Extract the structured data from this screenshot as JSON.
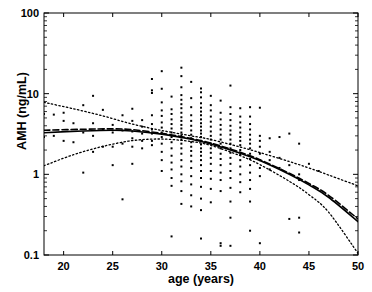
{
  "figure": {
    "name": "amh-vs-age-scatter-regression",
    "background": "#ffffff",
    "foreground": "#000000"
  },
  "chart_data": {
    "type": "scatter",
    "title": "",
    "xlabel": "age (years)",
    "ylabel": "AMH (ng/mL)",
    "xlim": [
      18,
      50
    ],
    "ylim": [
      0.1,
      100
    ],
    "yscale": "log",
    "xscale": "linear",
    "grid": false,
    "legend": "none",
    "xticks": [
      20,
      25,
      30,
      35,
      40,
      45,
      50
    ],
    "xtick_labels": [
      "20",
      "25",
      "30",
      "35",
      "40",
      "45",
      "50"
    ],
    "yticks": [
      0.1,
      1,
      10,
      100
    ],
    "ytick_labels": [
      "0.1",
      "1",
      "10",
      "100"
    ],
    "minor_log_ticks": true,
    "marker": "square",
    "marker_size": 2,
    "marker_color": "#000000",
    "series": [
      {
        "name": "AMH observations",
        "type": "scatter",
        "points": [
          [
            18,
            5.6
          ],
          [
            18,
            2.9
          ],
          [
            19,
            5.5
          ],
          [
            19,
            3.0
          ],
          [
            20,
            5.8
          ],
          [
            20,
            4.6
          ],
          [
            20,
            2.6
          ],
          [
            21,
            4.3
          ],
          [
            21,
            2.5
          ],
          [
            22,
            7.2
          ],
          [
            22,
            3.3
          ],
          [
            22,
            1.05
          ],
          [
            23,
            9.4
          ],
          [
            23,
            4.3
          ],
          [
            23,
            3.0
          ],
          [
            23,
            1.9
          ],
          [
            24,
            6.3
          ],
          [
            24,
            3.6
          ],
          [
            24,
            2.2
          ],
          [
            25,
            4.1
          ],
          [
            25,
            3.3
          ],
          [
            25,
            2.2
          ],
          [
            25,
            1.3
          ],
          [
            26,
            5.4
          ],
          [
            26,
            3.5
          ],
          [
            26,
            2.4
          ],
          [
            26,
            0.49
          ],
          [
            27,
            6.5
          ],
          [
            27,
            4.6
          ],
          [
            27,
            3.4
          ],
          [
            27,
            2.8
          ],
          [
            27,
            2.2
          ],
          [
            27,
            1.35
          ],
          [
            28,
            4.7
          ],
          [
            28,
            3.9
          ],
          [
            28,
            3.2
          ],
          [
            28,
            2.6
          ],
          [
            28,
            2.1
          ],
          [
            29,
            15.2
          ],
          [
            29,
            11.0
          ],
          [
            29,
            10.2
          ],
          [
            29,
            5.4
          ],
          [
            29,
            4.2
          ],
          [
            29,
            3.6
          ],
          [
            29,
            3.2
          ],
          [
            29,
            2.6
          ],
          [
            29,
            2.3
          ],
          [
            30,
            19.0
          ],
          [
            30,
            11.5
          ],
          [
            30,
            7.8
          ],
          [
            30,
            6.2
          ],
          [
            30,
            5.3
          ],
          [
            30,
            4.4
          ],
          [
            30,
            3.8
          ],
          [
            30,
            3.3
          ],
          [
            30,
            2.9
          ],
          [
            30,
            2.4
          ],
          [
            30,
            1.9
          ],
          [
            30,
            1.5
          ],
          [
            30,
            1.1
          ],
          [
            31,
            9.2
          ],
          [
            31,
            6.4
          ],
          [
            31,
            5.6
          ],
          [
            31,
            4.8
          ],
          [
            31,
            4.2
          ],
          [
            31,
            3.7
          ],
          [
            31,
            3.3
          ],
          [
            31,
            2.9
          ],
          [
            31,
            2.5
          ],
          [
            31,
            2.1
          ],
          [
            31,
            1.7
          ],
          [
            31,
            1.4
          ],
          [
            31,
            1.15
          ],
          [
            31,
            0.9
          ],
          [
            31,
            0.72
          ],
          [
            31,
            0.17
          ],
          [
            32,
            21.0
          ],
          [
            32,
            16.5
          ],
          [
            32,
            12.0
          ],
          [
            32,
            9.6
          ],
          [
            32,
            8.4
          ],
          [
            32,
            7.4
          ],
          [
            32,
            6.6
          ],
          [
            32,
            5.8
          ],
          [
            32,
            5.1
          ],
          [
            32,
            4.6
          ],
          [
            32,
            4.1
          ],
          [
            32,
            3.7
          ],
          [
            32,
            3.3
          ],
          [
            32,
            3.0
          ],
          [
            32,
            2.7
          ],
          [
            32,
            2.4
          ],
          [
            32,
            2.1
          ],
          [
            32,
            1.8
          ],
          [
            32,
            1.5
          ],
          [
            32,
            1.25
          ],
          [
            32,
            1.0
          ],
          [
            32,
            0.82
          ],
          [
            32,
            0.62
          ],
          [
            32,
            0.43
          ],
          [
            33,
            14.0
          ],
          [
            33,
            8.8
          ],
          [
            33,
            6.8
          ],
          [
            33,
            5.4
          ],
          [
            33,
            4.6
          ],
          [
            33,
            4.0
          ],
          [
            33,
            3.5
          ],
          [
            33,
            3.1
          ],
          [
            33,
            2.8
          ],
          [
            33,
            2.5
          ],
          [
            33,
            2.2
          ],
          [
            33,
            1.95
          ],
          [
            33,
            1.7
          ],
          [
            33,
            1.45
          ],
          [
            33,
            1.2
          ],
          [
            33,
            0.95
          ],
          [
            33,
            0.75
          ],
          [
            33,
            0.55
          ],
          [
            33,
            0.4
          ],
          [
            34,
            11.6
          ],
          [
            34,
            10.4
          ],
          [
            34,
            9.0
          ],
          [
            34,
            7.6
          ],
          [
            34,
            6.7
          ],
          [
            34,
            6.0
          ],
          [
            34,
            5.4
          ],
          [
            34,
            4.8
          ],
          [
            34,
            4.3
          ],
          [
            34,
            3.9
          ],
          [
            34,
            3.5
          ],
          [
            34,
            3.2
          ],
          [
            34,
            2.9
          ],
          [
            34,
            2.6
          ],
          [
            34,
            2.35
          ],
          [
            34,
            2.1
          ],
          [
            34,
            1.9
          ],
          [
            34,
            1.7
          ],
          [
            34,
            1.5
          ],
          [
            34,
            1.3
          ],
          [
            34,
            1.1
          ],
          [
            34,
            0.9
          ],
          [
            34,
            0.7
          ],
          [
            34,
            0.5
          ],
          [
            34,
            0.36
          ],
          [
            34,
            0.16
          ],
          [
            35,
            9.4
          ],
          [
            35,
            7.2
          ],
          [
            35,
            6.2
          ],
          [
            35,
            5.2
          ],
          [
            35,
            4.5
          ],
          [
            35,
            3.9
          ],
          [
            35,
            3.4
          ],
          [
            35,
            3.0
          ],
          [
            35,
            2.7
          ],
          [
            35,
            2.4
          ],
          [
            35,
            2.1
          ],
          [
            35,
            1.85
          ],
          [
            35,
            1.6
          ],
          [
            35,
            1.35
          ],
          [
            35,
            1.1
          ],
          [
            35,
            0.88
          ],
          [
            35,
            0.66
          ],
          [
            35,
            0.45
          ],
          [
            36,
            8.2
          ],
          [
            36,
            5.8
          ],
          [
            36,
            4.8
          ],
          [
            36,
            4.1
          ],
          [
            36,
            3.6
          ],
          [
            36,
            3.1
          ],
          [
            36,
            2.7
          ],
          [
            36,
            2.4
          ],
          [
            36,
            2.1
          ],
          [
            36,
            1.8
          ],
          [
            36,
            1.55
          ],
          [
            36,
            1.3
          ],
          [
            36,
            1.05
          ],
          [
            36,
            0.85
          ],
          [
            36,
            0.62
          ],
          [
            36,
            0.14
          ],
          [
            36,
            0.13
          ],
          [
            37,
            12.6
          ],
          [
            37,
            6.8
          ],
          [
            37,
            5.6
          ],
          [
            37,
            4.7
          ],
          [
            37,
            4.0
          ],
          [
            37,
            3.5
          ],
          [
            37,
            3.1
          ],
          [
            37,
            2.7
          ],
          [
            37,
            2.4
          ],
          [
            37,
            2.1
          ],
          [
            37,
            1.85
          ],
          [
            37,
            1.6
          ],
          [
            37,
            1.35
          ],
          [
            37,
            1.1
          ],
          [
            37,
            0.9
          ],
          [
            37,
            0.68
          ],
          [
            37,
            0.46
          ],
          [
            37,
            0.29
          ],
          [
            37,
            0.13
          ],
          [
            38,
            6.6
          ],
          [
            38,
            5.2
          ],
          [
            38,
            4.4
          ],
          [
            38,
            3.8
          ],
          [
            38,
            3.3
          ],
          [
            38,
            2.9
          ],
          [
            38,
            2.6
          ],
          [
            38,
            2.3
          ],
          [
            38,
            2.0
          ],
          [
            38,
            1.75
          ],
          [
            38,
            1.5
          ],
          [
            38,
            1.25
          ],
          [
            38,
            1.0
          ],
          [
            38,
            0.8
          ],
          [
            38,
            0.6
          ],
          [
            39,
            6.8
          ],
          [
            39,
            5.2
          ],
          [
            39,
            4.2
          ],
          [
            39,
            3.6
          ],
          [
            39,
            3.1
          ],
          [
            39,
            2.7
          ],
          [
            39,
            2.4
          ],
          [
            39,
            2.1
          ],
          [
            39,
            1.8
          ],
          [
            39,
            1.55
          ],
          [
            39,
            1.3
          ],
          [
            39,
            1.05
          ],
          [
            39,
            0.85
          ],
          [
            39,
            0.66
          ],
          [
            39,
            0.46
          ],
          [
            39,
            0.2
          ],
          [
            40,
            6.7
          ],
          [
            40,
            3.0
          ],
          [
            40,
            2.6
          ],
          [
            40,
            2.2
          ],
          [
            40,
            1.8
          ],
          [
            40,
            1.5
          ],
          [
            40,
            1.2
          ],
          [
            40,
            0.95
          ],
          [
            40,
            0.14
          ],
          [
            41,
            2.8
          ],
          [
            41,
            1.9
          ],
          [
            41,
            1.5
          ],
          [
            41,
            1.15
          ],
          [
            42,
            2.9
          ],
          [
            42,
            1.6
          ],
          [
            42,
            1.2
          ],
          [
            43,
            3.2
          ],
          [
            43,
            1.3
          ],
          [
            43,
            0.28
          ],
          [
            44,
            2.4
          ],
          [
            44,
            1.0
          ],
          [
            44,
            0.85
          ],
          [
            44,
            0.29
          ],
          [
            44,
            0.19
          ],
          [
            45,
            1.35
          ],
          [
            46,
            1.1
          ]
        ]
      },
      {
        "name": "fitted regression (solid)",
        "type": "line",
        "style": "solid",
        "anchors": [
          [
            18,
            3.28
          ],
          [
            22,
            3.45
          ],
          [
            25,
            3.52
          ],
          [
            27,
            3.45
          ],
          [
            30,
            3.15
          ],
          [
            33,
            2.72
          ],
          [
            35,
            2.38
          ],
          [
            38,
            1.83
          ],
          [
            40,
            1.48
          ],
          [
            43,
            1.0
          ],
          [
            45,
            0.74
          ],
          [
            47,
            0.52
          ],
          [
            50,
            0.26
          ]
        ]
      },
      {
        "name": "fitted regression (dashed)",
        "type": "line",
        "style": "dashed",
        "anchors": [
          [
            18,
            3.52
          ],
          [
            22,
            3.62
          ],
          [
            25,
            3.66
          ],
          [
            27,
            3.58
          ],
          [
            30,
            3.22
          ],
          [
            33,
            2.78
          ],
          [
            35,
            2.44
          ],
          [
            38,
            1.88
          ],
          [
            40,
            1.52
          ],
          [
            43,
            1.03
          ],
          [
            45,
            0.77
          ],
          [
            47,
            0.55
          ],
          [
            50,
            0.28
          ]
        ]
      },
      {
        "name": "upper bound (dotted)",
        "type": "line",
        "style": "dotted",
        "anchors": [
          [
            18,
            7.8
          ],
          [
            21,
            6.5
          ],
          [
            24,
            5.3
          ],
          [
            27,
            4.2
          ],
          [
            30,
            3.5
          ],
          [
            33,
            3.0
          ],
          [
            35,
            2.7
          ],
          [
            38,
            2.18
          ],
          [
            40,
            1.86
          ],
          [
            43,
            1.44
          ],
          [
            45,
            1.2
          ],
          [
            47,
            0.98
          ],
          [
            50,
            0.72
          ]
        ]
      },
      {
        "name": "lower bound (dotted)",
        "type": "line",
        "style": "dotted",
        "anchors": [
          [
            18,
            1.28
          ],
          [
            21,
            1.75
          ],
          [
            24,
            2.22
          ],
          [
            27,
            2.62
          ],
          [
            30,
            2.74
          ],
          [
            33,
            2.55
          ],
          [
            35,
            2.28
          ],
          [
            38,
            1.7
          ],
          [
            40,
            1.32
          ],
          [
            43,
            0.82
          ],
          [
            45,
            0.56
          ],
          [
            47,
            0.34
          ],
          [
            50,
            0.105
          ]
        ]
      }
    ]
  }
}
